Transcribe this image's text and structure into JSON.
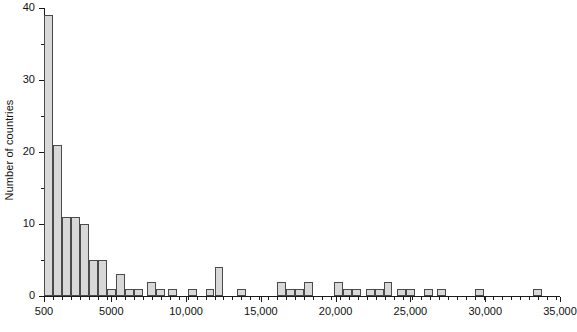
{
  "chart_data": {
    "type": "bar",
    "title": "",
    "subtitle": "",
    "xlabel": "",
    "ylabel": "Number of countries",
    "grid": false,
    "legend": null,
    "xlim": [
      500,
      35000
    ],
    "ylim": [
      0,
      40
    ],
    "xtick_labels": [
      "500",
      "5000",
      "10,000",
      "15,000",
      "20,000",
      "25,000",
      "30,000",
      "35,000"
    ],
    "xtick_values": [
      500,
      5000,
      10000,
      15000,
      20000,
      25000,
      30000,
      35000
    ],
    "ytick_labels": [
      "0",
      "10",
      "20",
      "30",
      "40"
    ],
    "ytick_values": [
      0,
      10,
      20,
      30,
      40
    ],
    "yminor_values": [
      5,
      15,
      25,
      35
    ],
    "bin_width": 600,
    "bar_fill_color": "#d8d8d8",
    "bar_edge_color": "#4a4a4a",
    "axis_color": "#1a1a1a",
    "background_color": "#ffffff",
    "bins": [
      {
        "x": 500,
        "value": 39
      },
      {
        "x": 1100,
        "value": 21
      },
      {
        "x": 1700,
        "value": 11
      },
      {
        "x": 2300,
        "value": 11
      },
      {
        "x": 2900,
        "value": 10
      },
      {
        "x": 3500,
        "value": 5
      },
      {
        "x": 4100,
        "value": 5
      },
      {
        "x": 4700,
        "value": 1
      },
      {
        "x": 5300,
        "value": 3
      },
      {
        "x": 5900,
        "value": 1
      },
      {
        "x": 6500,
        "value": 1
      },
      {
        "x": 7400,
        "value": 2
      },
      {
        "x": 8000,
        "value": 1
      },
      {
        "x": 8800,
        "value": 1
      },
      {
        "x": 10100,
        "value": 1
      },
      {
        "x": 11300,
        "value": 1
      },
      {
        "x": 11900,
        "value": 4
      },
      {
        "x": 13400,
        "value": 1
      },
      {
        "x": 16100,
        "value": 2
      },
      {
        "x": 16700,
        "value": 1
      },
      {
        "x": 17300,
        "value": 1
      },
      {
        "x": 17900,
        "value": 2
      },
      {
        "x": 19900,
        "value": 2
      },
      {
        "x": 20500,
        "value": 1
      },
      {
        "x": 21100,
        "value": 1
      },
      {
        "x": 22000,
        "value": 1
      },
      {
        "x": 22600,
        "value": 1
      },
      {
        "x": 23200,
        "value": 2
      },
      {
        "x": 24100,
        "value": 1
      },
      {
        "x": 24700,
        "value": 1
      },
      {
        "x": 25900,
        "value": 1
      },
      {
        "x": 26800,
        "value": 1
      },
      {
        "x": 29300,
        "value": 1
      },
      {
        "x": 33200,
        "value": 1
      }
    ]
  }
}
